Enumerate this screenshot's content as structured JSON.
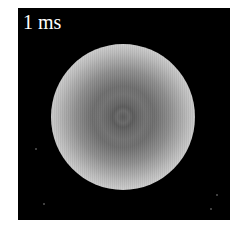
{
  "image": {
    "time_label": "1 ms",
    "background_color": "#000000",
    "subject": "bright circular disc with darker gray center and faint concentric ring",
    "disc_edge_color": "#dcdcdc",
    "disc_center_color": "#5a5a5a"
  }
}
